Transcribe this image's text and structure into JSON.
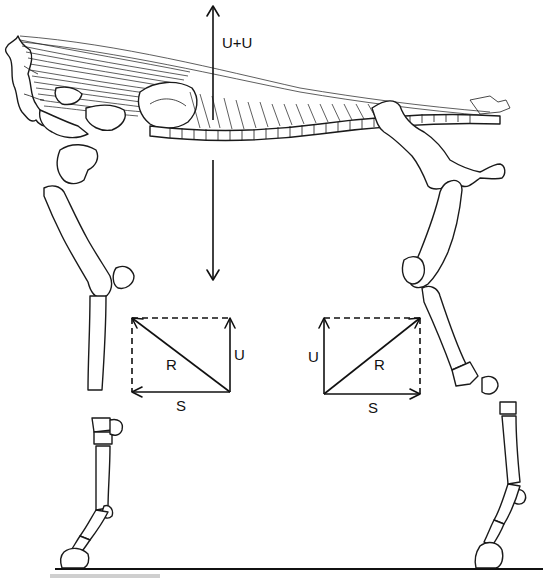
{
  "figure": {
    "line_color": "#1a1a1a",
    "background": "#ffffff",
    "vertical_force": {
      "label": "U+U",
      "up_arrow": {
        "x": 213,
        "y_from": 120,
        "y_to": 6
      },
      "down_arrow": {
        "x": 213,
        "y_from": 160,
        "y_to": 280
      }
    },
    "left_parallelogram": {
      "position": "forelimb",
      "corners": {
        "top_left": [
          132,
          318
        ],
        "top_right": [
          230,
          318
        ],
        "bottom_left": [
          132,
          392
        ],
        "bottom_right": [
          230,
          392
        ]
      },
      "labels": {
        "resultant": "R",
        "vertical": "U",
        "horizontal": "S"
      }
    },
    "right_parallelogram": {
      "position": "hindlimb",
      "corners": {
        "top_left": [
          324,
          318
        ],
        "top_right": [
          420,
          318
        ],
        "bottom_left": [
          324,
          394
        ],
        "bottom_right": [
          420,
          394
        ]
      },
      "labels": {
        "resultant": "R",
        "vertical": "U",
        "horizontal": "S"
      }
    },
    "ground_line": {
      "x_from": 55,
      "x_to": 543,
      "y": 569
    }
  }
}
